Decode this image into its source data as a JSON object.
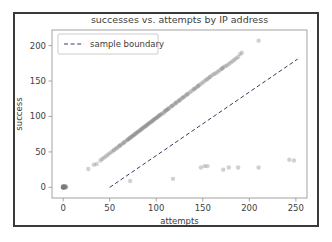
{
  "chart_data": {
    "type": "scatter",
    "title": "successes vs. attempts by IP address",
    "xlabel": "attempts",
    "ylabel": "success",
    "xlim": [
      -12,
      262
    ],
    "ylim": [
      -15,
      222
    ],
    "xticks": [
      0,
      50,
      100,
      150,
      200,
      250
    ],
    "yticks": [
      0,
      50,
      100,
      150,
      200
    ],
    "grid": false,
    "legend": {
      "position": "upper-left",
      "entries": [
        {
          "label": "sample boundary",
          "style": "dashed-line",
          "color": "#3b3b5c"
        }
      ]
    },
    "series": [
      {
        "name": "IP addresses",
        "type": "scatter",
        "marker": "circle",
        "color": "#7a7a7a",
        "alpha": 0.35,
        "points": [
          [
            0,
            0
          ],
          [
            0,
            0
          ],
          [
            0,
            0
          ],
          [
            1,
            0
          ],
          [
            1,
            1
          ],
          [
            0,
            1
          ],
          [
            2,
            0
          ],
          [
            1,
            0
          ],
          [
            0,
            0
          ],
          [
            2,
            1
          ],
          [
            1,
            1
          ],
          [
            0,
            0
          ],
          [
            3,
            1
          ],
          [
            0,
            0
          ],
          [
            1,
            0
          ],
          [
            2,
            2
          ],
          [
            0,
            1
          ],
          [
            1,
            0
          ],
          [
            0,
            0
          ],
          [
            2,
            0
          ],
          [
            0,
            2
          ],
          [
            1,
            1
          ],
          [
            0,
            0
          ],
          [
            3,
            0
          ],
          [
            27,
            26
          ],
          [
            33,
            32
          ],
          [
            36,
            33
          ],
          [
            40,
            38
          ],
          [
            42,
            40
          ],
          [
            44,
            42
          ],
          [
            46,
            44
          ],
          [
            48,
            46
          ],
          [
            50,
            48
          ],
          [
            52,
            50
          ],
          [
            54,
            52
          ],
          [
            55,
            53
          ],
          [
            57,
            55
          ],
          [
            58,
            56
          ],
          [
            60,
            58
          ],
          [
            61,
            59
          ],
          [
            62,
            60
          ],
          [
            64,
            62
          ],
          [
            65,
            63
          ],
          [
            66,
            64
          ],
          [
            68,
            66
          ],
          [
            69,
            67
          ],
          [
            70,
            68
          ],
          [
            71,
            69
          ],
          [
            72,
            70
          ],
          [
            73,
            71
          ],
          [
            74,
            72
          ],
          [
            75,
            73
          ],
          [
            76,
            74
          ],
          [
            77,
            75
          ],
          [
            78,
            76
          ],
          [
            79,
            77
          ],
          [
            80,
            78
          ],
          [
            81,
            79
          ],
          [
            82,
            80
          ],
          [
            83,
            81
          ],
          [
            84,
            82
          ],
          [
            85,
            83
          ],
          [
            86,
            84
          ],
          [
            87,
            85
          ],
          [
            88,
            86
          ],
          [
            89,
            87
          ],
          [
            90,
            88
          ],
          [
            91,
            89
          ],
          [
            92,
            90
          ],
          [
            93,
            91
          ],
          [
            94,
            92
          ],
          [
            95,
            93
          ],
          [
            96,
            94
          ],
          [
            97,
            95
          ],
          [
            98,
            96
          ],
          [
            99,
            97
          ],
          [
            100,
            98
          ],
          [
            101,
            99
          ],
          [
            102,
            100
          ],
          [
            103,
            101
          ],
          [
            104,
            102
          ],
          [
            105,
            103
          ],
          [
            106,
            104
          ],
          [
            108,
            105
          ],
          [
            109,
            107
          ],
          [
            110,
            108
          ],
          [
            111,
            109
          ],
          [
            112,
            110
          ],
          [
            113,
            111
          ],
          [
            114,
            112
          ],
          [
            116,
            114
          ],
          [
            117,
            115
          ],
          [
            118,
            116
          ],
          [
            120,
            118
          ],
          [
            121,
            119
          ],
          [
            122,
            120
          ],
          [
            124,
            122
          ],
          [
            125,
            123
          ],
          [
            126,
            124
          ],
          [
            128,
            126
          ],
          [
            129,
            127
          ],
          [
            130,
            128
          ],
          [
            132,
            130
          ],
          [
            133,
            131
          ],
          [
            134,
            132
          ],
          [
            136,
            134
          ],
          [
            138,
            136
          ],
          [
            140,
            138
          ],
          [
            141,
            139
          ],
          [
            142,
            140
          ],
          [
            144,
            142
          ],
          [
            145,
            143
          ],
          [
            146,
            144
          ],
          [
            148,
            146
          ],
          [
            150,
            148
          ],
          [
            152,
            150
          ],
          [
            154,
            152
          ],
          [
            155,
            153
          ],
          [
            157,
            155
          ],
          [
            158,
            156
          ],
          [
            160,
            158
          ],
          [
            162,
            160
          ],
          [
            164,
            161
          ],
          [
            166,
            163
          ],
          [
            168,
            165
          ],
          [
            170,
            167
          ],
          [
            171,
            168
          ],
          [
            172,
            169
          ],
          [
            174,
            171
          ],
          [
            176,
            172
          ],
          [
            178,
            174
          ],
          [
            180,
            176
          ],
          [
            182,
            178
          ],
          [
            184,
            180
          ],
          [
            186,
            182
          ],
          [
            188,
            184
          ],
          [
            190,
            188
          ],
          [
            192,
            190
          ],
          [
            210,
            207
          ],
          [
            72,
            9
          ],
          [
            118,
            12
          ],
          [
            148,
            28
          ],
          [
            152,
            30
          ],
          [
            155,
            30
          ],
          [
            172,
            25
          ],
          [
            178,
            28
          ],
          [
            188,
            28
          ],
          [
            210,
            28
          ],
          [
            243,
            39
          ],
          [
            248,
            38
          ]
        ]
      }
    ],
    "boundary_line": {
      "name": "sample boundary",
      "style": "dashed",
      "color": "#3b3b5c",
      "x_start": 50,
      "y_start": 0,
      "x_end": 252,
      "y_end": 181
    }
  },
  "axes": {
    "tick_labels_x": [
      "0",
      "50",
      "100",
      "150",
      "200",
      "250"
    ],
    "tick_labels_y": [
      "0",
      "50",
      "100",
      "150",
      "200"
    ]
  }
}
